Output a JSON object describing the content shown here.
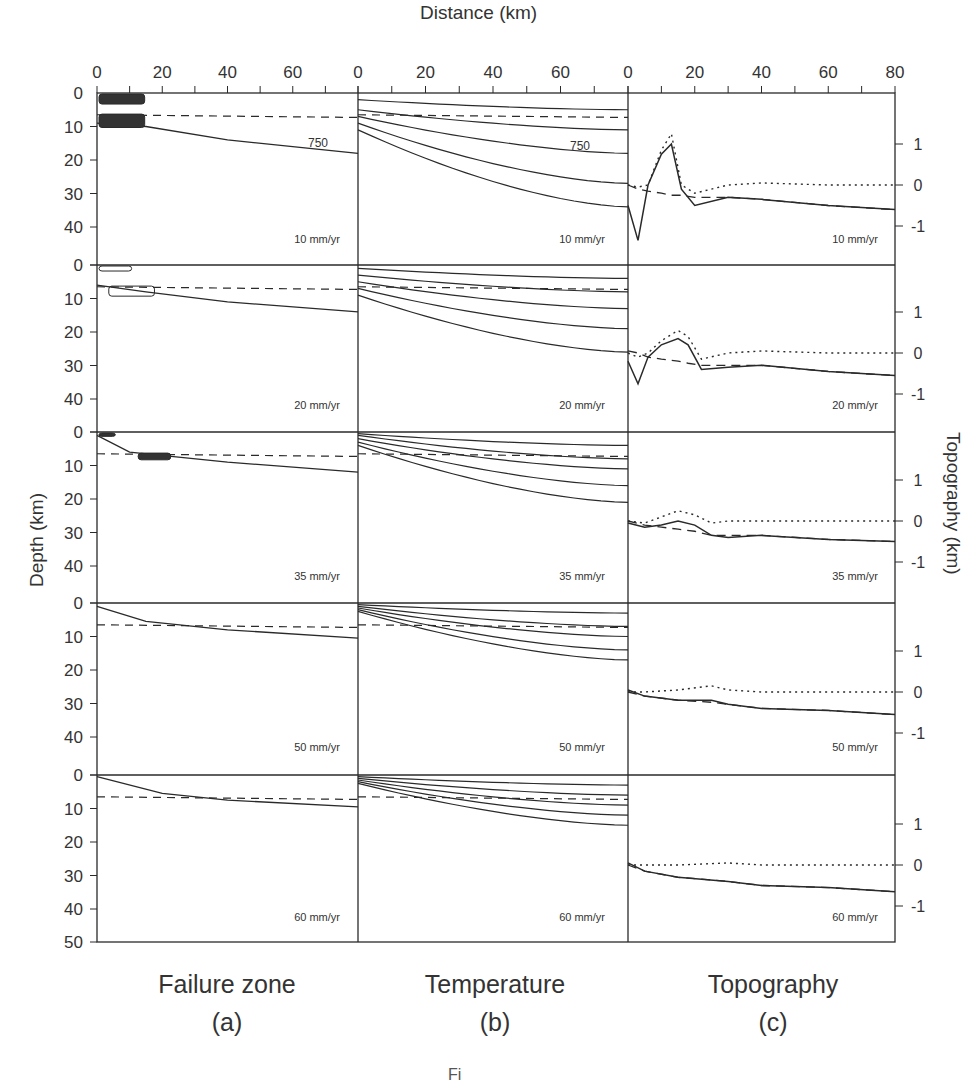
{
  "figure": {
    "x_axis_title": "Distance (km)",
    "y_axis_left_title": "Depth (km)",
    "y_axis_right_title": "Topography (km)",
    "caption_fragment": "Fi",
    "columns": [
      {
        "title": "Failure zone",
        "letter": "(a)"
      },
      {
        "title": "Temperature",
        "letter": "(b)"
      },
      {
        "title": "Topography",
        "letter": "(c)"
      }
    ],
    "rows": [
      "10 mm/yr",
      "20 mm/yr",
      "35 mm/yr",
      "50 mm/yr",
      "60 mm/yr"
    ],
    "x_ticks_ab": [
      "0",
      "20",
      "40",
      "60"
    ],
    "x_ticks_c": [
      "0",
      "20",
      "40",
      "60",
      "80"
    ],
    "depth_ticks": [
      "0",
      "10",
      "20",
      "30",
      "40"
    ],
    "depth_bottom_tick": "50",
    "topo_ticks": [
      "1",
      "0",
      "-1"
    ],
    "isotherm_label": "750",
    "colors": {
      "ink": "#2a2a2a",
      "background": "#ffffff"
    }
  },
  "chart_data": [
    {
      "type": "line",
      "title": "Failure zone (a)",
      "xlabel": "Distance (km)",
      "ylabel": "Depth (km)",
      "xlim": [
        0,
        80
      ],
      "ylim": [
        50,
        0
      ],
      "panels": [
        {
          "rate": "10 mm/yr",
          "isotherm_750_depth": {
            "x": [
              0,
              15,
              40,
              80
            ],
            "y": [
              9,
              10,
              14,
              18
            ]
          },
          "dashed_moho_depth": 6.5,
          "failure_zones": [
            {
              "x": [
                0,
                14
              ],
              "depth": [
                0,
                3
              ]
            },
            {
              "x": [
                0,
                14
              ],
              "depth": [
                6,
                10
              ]
            }
          ]
        },
        {
          "rate": "20 mm/yr",
          "isotherm_750_depth": {
            "x": [
              0,
              15,
              40,
              80
            ],
            "y": [
              6,
              8,
              11,
              14
            ]
          },
          "dashed_moho_depth": 6.5,
          "failure_zones": [
            {
              "x": [
                0,
                10
              ],
              "depth": [
                0,
                1.5
              ]
            },
            {
              "x": [
                3,
                17
              ],
              "depth": [
                6,
                9
              ]
            }
          ]
        },
        {
          "rate": "35 mm/yr",
          "isotherm_750_depth": {
            "x": [
              0,
              10,
              40,
              80
            ],
            "y": [
              1,
              6,
              9,
              12
            ]
          },
          "dashed_moho_depth": 6.5,
          "failure_zones": [
            {
              "x": [
                0,
                5
              ],
              "depth": [
                0,
                1
              ]
            },
            {
              "x": [
                12,
                22
              ],
              "depth": [
                6,
                8
              ]
            }
          ]
        },
        {
          "rate": "50 mm/yr",
          "isotherm_750_depth": {
            "x": [
              0,
              15,
              40,
              80
            ],
            "y": [
              1,
              5.5,
              8,
              10.5
            ]
          },
          "dashed_moho_depth": 6.5
        },
        {
          "rate": "60 mm/yr",
          "isotherm_750_depth": {
            "x": [
              0,
              20,
              40,
              80
            ],
            "y": [
              0.5,
              5.5,
              7.5,
              9.5
            ]
          },
          "dashed_moho_depth": 6.5
        }
      ]
    },
    {
      "type": "line",
      "title": "Temperature (b)",
      "xlabel": "Distance (km)",
      "ylabel": "Depth (km)",
      "xlim": [
        0,
        80
      ],
      "ylim": [
        50,
        0
      ],
      "note": "Isotherm contours; 750 labeled; dashed line = Moho",
      "panels": [
        {
          "rate": "10 mm/yr",
          "isotherm_depths_at_x0": [
            2,
            5,
            7,
            9,
            11
          ],
          "isotherm_depths_at_x80": [
            5,
            11,
            18,
            27,
            34
          ]
        },
        {
          "rate": "20 mm/yr",
          "isotherm_depths_at_x0": [
            1,
            3,
            5,
            7,
            9
          ],
          "isotherm_depths_at_x80": [
            4,
            8,
            13,
            19,
            26
          ]
        },
        {
          "rate": "35 mm/yr",
          "isotherm_depths_at_x0": [
            0.5,
            1,
            2,
            3,
            4
          ],
          "isotherm_depths_at_x80": [
            4,
            8,
            11,
            16,
            21
          ]
        },
        {
          "rate": "50 mm/yr",
          "isotherm_depths_at_x0": [
            0.5,
            1,
            1.5,
            2,
            2.5
          ],
          "isotherm_depths_at_x80": [
            3,
            7,
            10,
            14,
            17
          ]
        },
        {
          "rate": "60 mm/yr",
          "isotherm_depths_at_x0": [
            0.5,
            1,
            1.5,
            2,
            2.5
          ],
          "isotherm_depths_at_x80": [
            3,
            6,
            9,
            12,
            15
          ]
        }
      ]
    },
    {
      "type": "line",
      "title": "Topography (c)",
      "xlabel": "Distance (km)",
      "ylabel": "Topography (km)",
      "xlim": [
        0,
        80
      ],
      "ylim": [
        -1.5,
        2
      ],
      "legend": [
        "solid: total",
        "dotted",
        "dashed"
      ],
      "panels": [
        {
          "rate": "10 mm/yr",
          "x": [
            0,
            3,
            6,
            10,
            13,
            16,
            20,
            30,
            40,
            60,
            80
          ],
          "solid": [
            -0.5,
            -1.35,
            0.0,
            0.75,
            1.0,
            -0.1,
            -0.5,
            -0.3,
            -0.35,
            -0.5,
            -0.6
          ],
          "dotted": [
            0.0,
            -0.05,
            0.0,
            0.85,
            1.25,
            0.0,
            -0.2,
            0.0,
            0.05,
            0.0,
            0.0
          ],
          "dashed": [
            0.0,
            -0.1,
            -0.15,
            -0.2,
            -0.25,
            -0.25,
            -0.3,
            -0.3,
            -0.35,
            -0.5,
            -0.6
          ]
        },
        {
          "rate": "20 mm/yr",
          "x": [
            0,
            3,
            6,
            10,
            15,
            18,
            22,
            30,
            40,
            60,
            80
          ],
          "solid": [
            -0.2,
            -0.75,
            -0.1,
            0.2,
            0.35,
            0.2,
            -0.4,
            -0.35,
            -0.3,
            -0.45,
            -0.55
          ],
          "dotted": [
            0.0,
            -0.1,
            0.0,
            0.3,
            0.55,
            0.4,
            -0.15,
            0.0,
            0.05,
            0.0,
            0.0
          ],
          "dashed": [
            0.05,
            0.0,
            -0.1,
            -0.15,
            -0.2,
            -0.25,
            -0.3,
            -0.3,
            -0.3,
            -0.45,
            -0.55
          ]
        },
        {
          "rate": "35 mm/yr",
          "x": [
            0,
            5,
            10,
            15,
            20,
            25,
            30,
            40,
            60,
            80
          ],
          "solid": [
            -0.05,
            -0.15,
            -0.1,
            0.0,
            -0.1,
            -0.35,
            -0.4,
            -0.35,
            -0.45,
            -0.5
          ],
          "dotted": [
            0.0,
            -0.05,
            0.1,
            0.25,
            0.15,
            -0.05,
            0.0,
            0.0,
            0.0,
            0.0
          ],
          "dashed": [
            0.0,
            -0.1,
            -0.15,
            -0.2,
            -0.25,
            -0.35,
            -0.35,
            -0.35,
            -0.45,
            -0.5
          ]
        },
        {
          "rate": "50 mm/yr",
          "x": [
            0,
            5,
            15,
            25,
            30,
            40,
            60,
            80
          ],
          "solid": [
            0.05,
            -0.1,
            -0.2,
            -0.2,
            -0.3,
            -0.4,
            -0.45,
            -0.55
          ],
          "dotted": [
            0.0,
            0.0,
            0.05,
            0.15,
            0.05,
            0.0,
            0.0,
            0.0
          ],
          "dashed": [
            0.0,
            -0.1,
            -0.2,
            -0.25,
            -0.3,
            -0.4,
            -0.45,
            -0.55
          ]
        },
        {
          "rate": "60 mm/yr",
          "x": [
            0,
            5,
            15,
            30,
            40,
            60,
            80
          ],
          "solid": [
            0.05,
            -0.15,
            -0.3,
            -0.4,
            -0.5,
            -0.55,
            -0.65
          ],
          "dotted": [
            0.0,
            0.0,
            0.0,
            0.05,
            0.0,
            0.0,
            0.0
          ],
          "dashed": [
            0.0,
            -0.15,
            -0.3,
            -0.4,
            -0.5,
            -0.55,
            -0.65
          ]
        }
      ]
    }
  ]
}
